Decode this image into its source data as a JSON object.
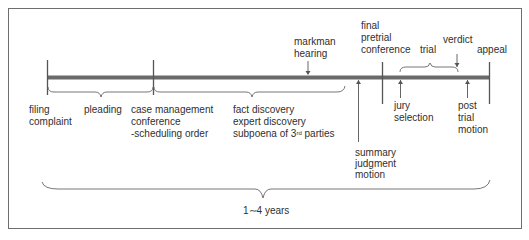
{
  "diagram": {
    "duration_label": "1∼4 years",
    "colors": {
      "frame": "#6e6e6e",
      "timeline_bar": "#6a6a6a",
      "text": "#2f2f2f",
      "lines": "#555555"
    },
    "milestones": {
      "filing": {
        "line1": "filing",
        "line2": "complaint"
      },
      "pleading": {
        "label": "pleading"
      },
      "case_management": {
        "line1": "case management",
        "line2": "conference",
        "line3": "-scheduling order"
      },
      "discovery": {
        "line1": "fact discovery",
        "line2": "expert discovery",
        "line3_prefix": "subpoena of 3",
        "line3_sup": "rd",
        "line3_suffix": " parties"
      },
      "markman": {
        "line1": "markman",
        "line2": "hearing"
      },
      "summary_judgment": {
        "line1": "summary",
        "line2": "judgment",
        "line3": "motion"
      },
      "final_pretrial": {
        "line1": "final",
        "line2": "pretrial",
        "line3": "conference"
      },
      "trial": {
        "label": "trial"
      },
      "verdict": {
        "label": "verdict"
      },
      "jury_selection": {
        "line1": "jury",
        "line2": "selection"
      },
      "post_trial": {
        "line1": "post",
        "line2": "trial",
        "line3": "motion"
      },
      "appeal": {
        "label": "appeal"
      }
    }
  }
}
